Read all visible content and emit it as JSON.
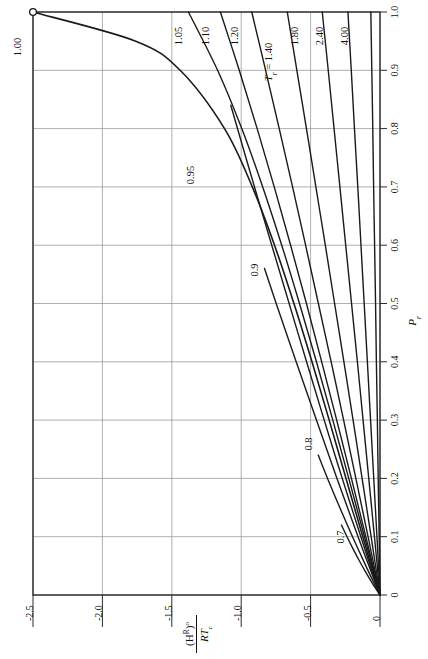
{
  "figure": {
    "orientation": "rotated-90-ccw",
    "background": "#ffffff",
    "curve_color": "#1a1a1a",
    "grid_color": "#9a9a9a",
    "axis_color": "#2b2b2b"
  },
  "axes": {
    "pr": {
      "title": "P",
      "title_sub": "r",
      "ticks": [
        "0",
        "0.1",
        "0.2",
        "0.3",
        "0.4",
        "0.5",
        "0.6",
        "0.7",
        "0.8",
        "0.9",
        "1.0"
      ],
      "tick_values": [
        0,
        0.1,
        0.2,
        0.3,
        0.4,
        0.5,
        0.6,
        0.7,
        0.8,
        0.9,
        1.0
      ],
      "range": [
        0,
        1.0
      ]
    },
    "hr": {
      "title_numerator": "(H",
      "title_numerator_sup": "R",
      "title_numerator_close": ")",
      "title_numerator_deg": "o",
      "title_denominator": "RT",
      "title_denominator_sub": "c",
      "ticks": [
        "-2.5",
        "-2.0",
        "-1.5",
        "-1.0",
        "-0.5",
        "0"
      ],
      "tick_values": [
        -2.5,
        -2.0,
        -1.5,
        -1.0,
        -0.5,
        0
      ],
      "range": [
        -2.5,
        0
      ]
    }
  },
  "parameter_label": {
    "symbol": "T",
    "sub": "r",
    "eq": " = ",
    "value": "1.40"
  },
  "curve_labels": [
    {
      "text": "1.00",
      "x": 21,
      "y": 47
    },
    {
      "text": "0.95",
      "x": 194,
      "y": 175
    },
    {
      "text": "0.9",
      "x": 258,
      "y": 270
    },
    {
      "text": "0.8",
      "x": 312,
      "y": 444
    },
    {
      "text": "0.7",
      "x": 344,
      "y": 537
    },
    {
      "text": "1.05",
      "x": 182,
      "y": 36
    },
    {
      "text": "1.10",
      "x": 209,
      "y": 36
    },
    {
      "text": "1.20",
      "x": 238,
      "y": 36
    },
    {
      "text": "1.80",
      "x": 298,
      "y": 36
    },
    {
      "text": "2.40",
      "x": 323,
      "y": 36
    },
    {
      "text": "4.00",
      "x": 348,
      "y": 36
    }
  ],
  "chart_data": {
    "type": "line",
    "title": "",
    "xlabel": "(H^R)o / RTc",
    "ylabel": "Pr",
    "xlim": [
      -2.5,
      0
    ],
    "ylim": [
      0,
      1.0
    ],
    "grid": true,
    "legend": "inline-curve-labels",
    "x_ticks": [
      -2.5,
      -2.0,
      -1.5,
      -1.0,
      -0.5,
      0
    ],
    "y_ticks": [
      0,
      0.1,
      0.2,
      0.3,
      0.4,
      0.5,
      0.6,
      0.7,
      0.8,
      0.9,
      1.0
    ],
    "note": "Lee-Kesler simple-fluid residual enthalpy. Each series is an isotherm Tr; x = (H^R)o/RTc, y = Pr.",
    "series": [
      {
        "name": "0.70",
        "label": "0.7",
        "Pr": [
          0,
          0.02,
          0.04,
          0.06,
          0.08,
          0.1,
          0.12
        ],
        "H": [
          0,
          -0.055,
          -0.105,
          -0.152,
          -0.196,
          -0.238,
          -0.278
        ]
      },
      {
        "name": "0.80",
        "label": "0.8",
        "Pr": [
          0,
          0.02,
          0.05,
          0.1,
          0.15,
          0.2,
          0.24
        ],
        "H": [
          0,
          -0.042,
          -0.102,
          -0.198,
          -0.29,
          -0.378,
          -0.445
        ]
      },
      {
        "name": "0.90",
        "label": "0.9",
        "Pr": [
          0,
          0.05,
          0.1,
          0.2,
          0.3,
          0.4,
          0.5,
          0.56
        ],
        "H": [
          0,
          -0.08,
          -0.158,
          -0.31,
          -0.458,
          -0.604,
          -0.748,
          -0.832
        ]
      },
      {
        "name": "0.95",
        "label": "0.95",
        "Pr": [
          0,
          0.05,
          0.1,
          0.2,
          0.3,
          0.45,
          0.6,
          0.75,
          0.84
        ],
        "H": [
          0,
          -0.07,
          -0.138,
          -0.272,
          -0.402,
          -0.592,
          -0.78,
          -0.966,
          -1.075
        ]
      },
      {
        "name": "1.00",
        "label": "1.00",
        "Pr": [
          0,
          0.05,
          0.1,
          0.2,
          0.3,
          0.4,
          0.5,
          0.6,
          0.7,
          0.8,
          0.9,
          0.95,
          1.0
        ],
        "H": [
          0,
          -0.063,
          -0.124,
          -0.245,
          -0.366,
          -0.49,
          -0.62,
          -0.76,
          -0.92,
          -1.12,
          -1.44,
          -1.76,
          -2.5
        ]
      },
      {
        "name": "1.05",
        "label": "1.05",
        "Pr": [
          0,
          0.1,
          0.2,
          0.3,
          0.4,
          0.5,
          0.6,
          0.7,
          0.8,
          0.9,
          1.0
        ],
        "H": [
          0,
          -0.112,
          -0.225,
          -0.34,
          -0.458,
          -0.58,
          -0.708,
          -0.845,
          -0.996,
          -1.17,
          -1.38
        ]
      },
      {
        "name": "1.10",
        "label": "1.10",
        "Pr": [
          0,
          0.1,
          0.2,
          0.3,
          0.4,
          0.5,
          0.6,
          0.7,
          0.8,
          0.9,
          1.0
        ],
        "H": [
          0,
          -0.102,
          -0.206,
          -0.312,
          -0.42,
          -0.53,
          -0.644,
          -0.762,
          -0.885,
          -1.014,
          -1.15
        ]
      },
      {
        "name": "1.20",
        "label": "1.20",
        "Pr": [
          0,
          0.1,
          0.2,
          0.3,
          0.4,
          0.5,
          0.6,
          0.7,
          0.8,
          0.9,
          1.0
        ],
        "H": [
          0,
          -0.086,
          -0.174,
          -0.262,
          -0.352,
          -0.444,
          -0.536,
          -0.63,
          -0.726,
          -0.824,
          -0.924
        ]
      },
      {
        "name": "1.40",
        "label": "1.40",
        "Pr": [
          0,
          0.1,
          0.2,
          0.3,
          0.4,
          0.5,
          0.6,
          0.7,
          0.8,
          0.9,
          1.0
        ],
        "H": [
          0,
          -0.064,
          -0.129,
          -0.194,
          -0.26,
          -0.327,
          -0.394,
          -0.462,
          -0.53,
          -0.599,
          -0.668
        ]
      },
      {
        "name": "1.80",
        "label": "1.80",
        "Pr": [
          0,
          0.1,
          0.2,
          0.3,
          0.4,
          0.5,
          0.6,
          0.7,
          0.8,
          0.9,
          1.0
        ],
        "H": [
          0,
          -0.04,
          -0.081,
          -0.122,
          -0.163,
          -0.205,
          -0.247,
          -0.289,
          -0.331,
          -0.373,
          -0.416
        ]
      },
      {
        "name": "2.40",
        "label": "2.40",
        "Pr": [
          0,
          0.1,
          0.2,
          0.3,
          0.4,
          0.5,
          0.6,
          0.7,
          0.8,
          0.9,
          1.0
        ],
        "H": [
          0,
          -0.022,
          -0.045,
          -0.068,
          -0.091,
          -0.114,
          -0.137,
          -0.16,
          -0.184,
          -0.207,
          -0.231
        ]
      },
      {
        "name": "4.00",
        "label": "4.00",
        "Pr": [
          0,
          0.1,
          0.2,
          0.3,
          0.4,
          0.5,
          0.6,
          0.7,
          0.8,
          0.9,
          1.0
        ],
        "H": [
          0,
          -0.006,
          -0.013,
          -0.019,
          -0.026,
          -0.032,
          -0.039,
          -0.046,
          -0.052,
          -0.059,
          -0.066
        ]
      }
    ],
    "critical_point_marker": {
      "Pr": 1.0,
      "H": -2.5,
      "style": "open-circle"
    }
  }
}
